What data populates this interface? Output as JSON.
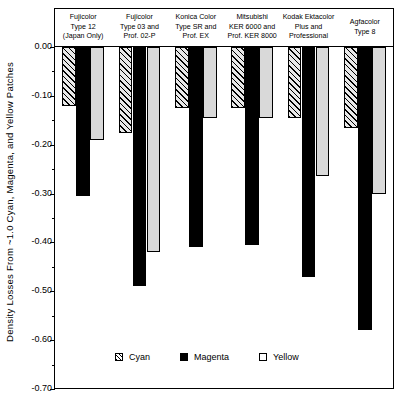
{
  "chart_data": {
    "type": "bar",
    "title": "",
    "xlabel": "",
    "ylabel": "Density Losses From ~1.0 Cyan, Magenta, and Yellow Patches",
    "ylim": [
      -0.7,
      0.0
    ],
    "y_ticks": [
      "0.00",
      "-0.10",
      "-0.20",
      "-0.30",
      "-0.40",
      "-0.50",
      "-0.60",
      "-0.70"
    ],
    "y_tick_values": [
      0.0,
      -0.1,
      -0.2,
      -0.3,
      -0.4,
      -0.5,
      -0.6,
      -0.7
    ],
    "y_minor_tick_values": [
      -0.05,
      -0.15,
      -0.25,
      -0.35,
      -0.45,
      -0.55,
      -0.65
    ],
    "grid": false,
    "legend_position": "inside-bottom-left",
    "categories": [
      "Fujicolor Type 12 (Japan Only)",
      "Fujicolor Type 03 and Prof. 02-P",
      "Konica Color Type SR and Prof. EX",
      "Mitsubishi KER 6000 and Prof. KER 8000",
      "Kodak Ektacolor Plus and Professional",
      "Agfacolor Type 8"
    ],
    "category_lines": [
      [
        "Fujicolor",
        "Type 12",
        "(Japan Only)"
      ],
      [
        "Fujicolor",
        "Type 03 and",
        "Prof. 02-P"
      ],
      [
        "Konica Color",
        "Type SR and",
        "Prof. EX"
      ],
      [
        "Mitsubishi",
        "KER 6000 and",
        "Prof. KER 8000"
      ],
      [
        "Kodak Ektacolor",
        "Plus and",
        "Professional"
      ],
      [
        "Agfacolor",
        "Type 8"
      ]
    ],
    "series": [
      {
        "name": "Cyan",
        "key": "cyan",
        "color": "#e8e8e8",
        "pattern": "diagonal-hatch",
        "values": [
          -0.12,
          -0.175,
          -0.125,
          -0.125,
          -0.145,
          -0.165
        ]
      },
      {
        "name": "Magenta",
        "key": "magenta",
        "color": "#000000",
        "pattern": "solid-black",
        "values": [
          -0.305,
          -0.49,
          -0.41,
          -0.405,
          -0.47,
          -0.58
        ]
      },
      {
        "name": "Yellow",
        "key": "yellow",
        "color": "#d9d9d9",
        "pattern": "light-gray",
        "values": [
          -0.19,
          -0.42,
          -0.145,
          -0.145,
          -0.265,
          -0.3
        ]
      }
    ]
  },
  "legend": {
    "items": [
      {
        "label": "Cyan",
        "key": "cyan"
      },
      {
        "label": "Magenta",
        "key": "magenta"
      },
      {
        "label": "Yellow",
        "key": "yellow"
      }
    ]
  }
}
